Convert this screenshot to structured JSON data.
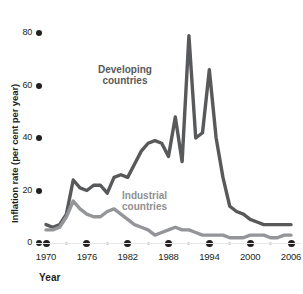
{
  "chart_data": {
    "type": "line",
    "title": "",
    "xlabel": "Year",
    "ylabel": "Inflation rate (per cent per year)",
    "xlim": [
      1970,
      2006
    ],
    "ylim": [
      0,
      80
    ],
    "xticks": [
      "1970",
      "1976",
      "1982",
      "1988",
      "1994",
      "2000",
      "2006"
    ],
    "xtick_values": [
      1970,
      1976,
      1982,
      1988,
      1994,
      2000,
      2006
    ],
    "minor_xtick_values": [
      1973,
      1979,
      1985,
      1991,
      1997,
      2003
    ],
    "yticks": [
      "0",
      "20",
      "40",
      "60",
      "80"
    ],
    "ytick_values": [
      0,
      20,
      40,
      60,
      80
    ],
    "grid": false,
    "legend_position": "inline-annotation",
    "x": [
      1970,
      1971,
      1972,
      1973,
      1974,
      1975,
      1976,
      1977,
      1978,
      1979,
      1980,
      1981,
      1982,
      1983,
      1984,
      1985,
      1986,
      1987,
      1988,
      1989,
      1990,
      1991,
      1992,
      1993,
      1994,
      1995,
      1996,
      1997,
      1998,
      1999,
      2000,
      2001,
      2002,
      2003,
      2004,
      2005,
      2006
    ],
    "series": [
      {
        "name": "Developing countries",
        "color": "#58595b",
        "values": [
          7,
          6,
          7,
          11,
          24,
          21,
          20,
          22,
          22,
          19,
          25,
          26,
          25,
          30,
          35,
          38,
          39,
          38,
          33,
          48,
          31,
          79,
          40,
          42,
          66,
          40,
          25,
          14,
          12,
          11,
          9,
          8,
          7,
          7,
          7,
          7,
          7
        ]
      },
      {
        "name": "Industrial countries",
        "color": "#939598",
        "values": [
          5,
          5,
          6,
          10,
          16,
          13,
          11,
          10,
          10,
          12,
          13,
          11,
          9,
          7,
          6,
          5,
          3,
          4,
          5,
          6,
          5,
          5,
          4,
          3,
          3,
          3,
          3,
          2,
          2,
          2,
          3,
          3,
          3,
          2,
          2,
          3,
          3
        ]
      }
    ],
    "annotations": [
      {
        "text": "Developing\ncountries",
        "at_year": 1986,
        "at_value": 57,
        "color": "#58595b"
      },
      {
        "text": "Industrial\ncountries",
        "at_year": 1990,
        "at_value": 18,
        "color": "#8e9092"
      }
    ]
  }
}
